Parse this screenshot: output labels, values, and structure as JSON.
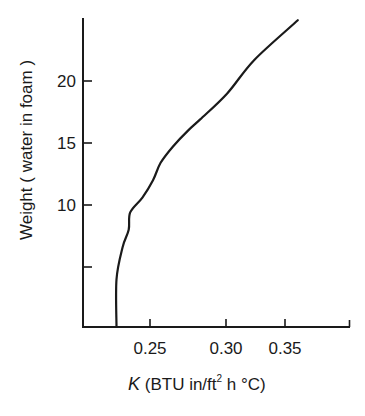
{
  "chart_data": {
    "type": "line",
    "title": "",
    "xlabel": "K (BTU in/ft² h °C)",
    "xlabel_parts": {
      "symbol": "K",
      "pre": "(BTU in/ft",
      "sup": "2",
      "post": " h °C)"
    },
    "ylabel": "Weight ( water in foam )",
    "x_ticks": [
      0.25,
      0.3,
      0.35
    ],
    "x_tick_labels": [
      "0.25",
      "0.30",
      "0.35"
    ],
    "y_ticks": [
      5,
      10,
      15,
      20
    ],
    "y_tick_labels": [
      "",
      "10",
      "15",
      "20"
    ],
    "xlim": [
      0.206,
      0.4
    ],
    "ylim": [
      0,
      25
    ],
    "grid": false,
    "legend": null,
    "series": [
      {
        "name": "Weight vs K",
        "x": [
          0.228,
          0.228,
          0.232,
          0.236,
          0.237,
          0.245,
          0.252,
          0.257,
          0.265,
          0.275,
          0.283,
          0.301,
          0.324,
          0.36
        ],
        "y": [
          0.2,
          4.0,
          6.6,
          8.0,
          9.4,
          10.6,
          12.0,
          13.4,
          14.7,
          16.0,
          16.9,
          19.0,
          21.7,
          24.9
        ]
      }
    ]
  }
}
